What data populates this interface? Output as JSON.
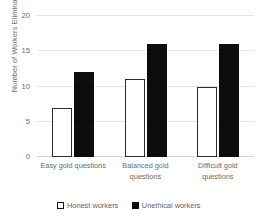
{
  "chart_data": {
    "type": "bar",
    "title": "",
    "xlabel": "",
    "ylabel": "Number of Workers Eliminated",
    "ylim": [
      0,
      20
    ],
    "yticks": [
      0,
      5,
      10,
      15,
      20
    ],
    "ytick_labels": [
      "0",
      "5",
      "10",
      "15",
      "20"
    ],
    "grid": true,
    "legend_position": "bottom",
    "categories": [
      "Easy gold questions",
      "Balanced gold\nquestions",
      "Difficult gold\nquestions"
    ],
    "series": [
      {
        "name": "Honest  workers",
        "values": [
          7,
          11,
          10
        ],
        "fill": "#ffffff",
        "stroke": "#2b2b2b"
      },
      {
        "name": "Unethical workers",
        "values": [
          12,
          16,
          16
        ],
        "fill": "#0d0d0d",
        "stroke": "#0d0d0d"
      }
    ]
  },
  "legend": {
    "items": [
      {
        "label": "Honest  workers",
        "style": "honest"
      },
      {
        "label": "Unethical workers",
        "style": "unethical"
      }
    ]
  },
  "colors": {
    "background": "#ffffff",
    "gridline": "#e6e6e6",
    "axis_text": "#6b6b6b",
    "honest_fill": "#ffffff",
    "honest_stroke": "#2b2b2b",
    "unethical_fill": "#0d0d0d"
  }
}
